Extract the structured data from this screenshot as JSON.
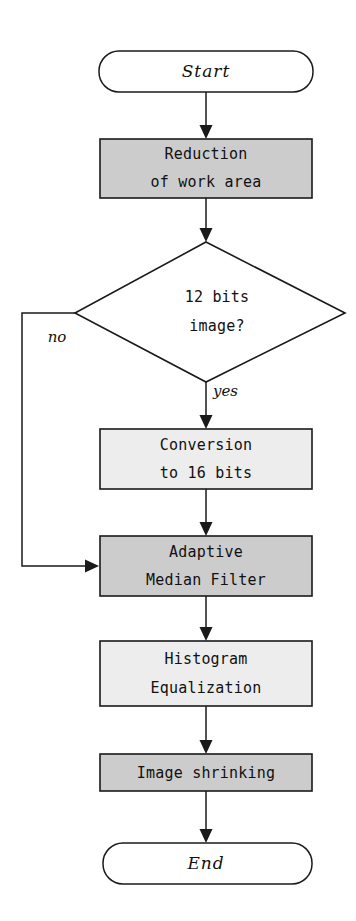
{
  "diagram": {
    "type": "flowchart",
    "orientation": "vertical",
    "title": "",
    "colors": {
      "stroke": "#1a1a1a",
      "text": "#111111",
      "background": "#ffffff",
      "fill_gray_dark": "#cccccc",
      "fill_gray_light": "#ededed",
      "fill_white": "#ffffff"
    },
    "nodes": [
      {
        "id": "start",
        "shape": "terminal",
        "label": "Start",
        "fill": "white",
        "style": "italic-serif"
      },
      {
        "id": "reduction",
        "shape": "process",
        "label_line1": "Reduction",
        "label_line2": "of work area",
        "fill": "gray-dark"
      },
      {
        "id": "decision",
        "shape": "decision",
        "label_line1": "12 bits",
        "label_line2": "image?",
        "fill": "white"
      },
      {
        "id": "conversion",
        "shape": "process",
        "label_line1": "Conversion",
        "label_line2": "to 16 bits",
        "fill": "gray-light"
      },
      {
        "id": "median",
        "shape": "process",
        "label_line1": "Adaptive",
        "label_line2": "Median Filter",
        "fill": "gray-dark"
      },
      {
        "id": "histogram",
        "shape": "process",
        "label_line1": "Histogram",
        "label_line2": "Equalization",
        "fill": "gray-light"
      },
      {
        "id": "shrinking",
        "shape": "process",
        "label_line1": "Image shrinking",
        "label_line2": "",
        "fill": "gray-dark"
      },
      {
        "id": "end",
        "shape": "terminal",
        "label": "End",
        "fill": "white",
        "style": "italic-serif"
      }
    ],
    "edges": [
      {
        "id": "start-to-reduction",
        "from": "start",
        "to": "reduction",
        "label": ""
      },
      {
        "id": "reduction-to-decision",
        "from": "reduction",
        "to": "decision",
        "label": ""
      },
      {
        "id": "decision-no-to-median",
        "from": "decision",
        "to": "median",
        "label": "no"
      },
      {
        "id": "decision-yes-to-conversion",
        "from": "decision",
        "to": "conversion",
        "label": "yes"
      },
      {
        "id": "conversion-to-median",
        "from": "conversion",
        "to": "median",
        "label": ""
      },
      {
        "id": "median-to-histogram",
        "from": "median",
        "to": "histogram",
        "label": ""
      },
      {
        "id": "histogram-to-shrinking",
        "from": "histogram",
        "to": "shrinking",
        "label": ""
      },
      {
        "id": "shrinking-to-end",
        "from": "shrinking",
        "to": "end",
        "label": ""
      }
    ]
  }
}
